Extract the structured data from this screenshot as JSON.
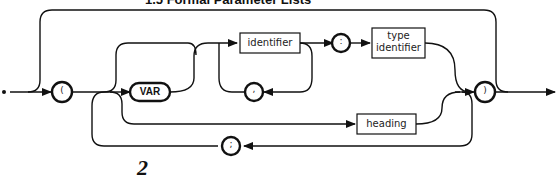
{
  "title": "1.5 Formal Parameter Lists",
  "page_number": "2",
  "diagram": {
    "name": "formal parameter list",
    "terminals": {
      "open_paren": "(",
      "var_keyword": "VAR",
      "comma": ",",
      "colon": ":",
      "close_paren": ")",
      "semicolon": ";"
    },
    "nonterminals": {
      "identifier": "identifier",
      "type_identifier_line1": "type",
      "type_identifier_line2": "identifier",
      "heading": "heading"
    },
    "stroke_color": "#111111",
    "background_color": "#ffffff"
  }
}
